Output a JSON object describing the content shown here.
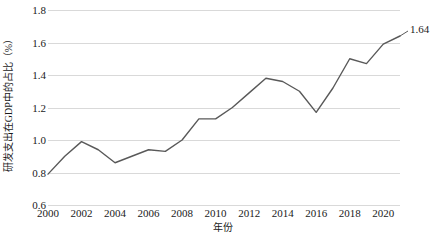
{
  "chart_data": {
    "type": "line",
    "title": "",
    "xlabel": "年份",
    "ylabel": "研发支出在GDP中的占比（%）",
    "x": [
      2000,
      2001,
      2002,
      2003,
      2004,
      2005,
      2006,
      2007,
      2008,
      2009,
      2010,
      2011,
      2012,
      2013,
      2014,
      2015,
      2016,
      2017,
      2018,
      2019,
      2020,
      2021
    ],
    "values": [
      0.79,
      0.9,
      0.99,
      0.94,
      0.86,
      0.9,
      0.94,
      0.93,
      1.0,
      1.13,
      1.13,
      1.2,
      1.29,
      1.38,
      1.36,
      1.3,
      1.17,
      1.32,
      1.5,
      1.47,
      1.59,
      1.64
    ],
    "series": [
      {
        "name": "研发支出在GDP中的占比（%）",
        "values": [
          0.79,
          0.9,
          0.99,
          0.94,
          0.86,
          0.9,
          0.94,
          0.93,
          1.0,
          1.13,
          1.13,
          1.2,
          1.29,
          1.38,
          1.36,
          1.3,
          1.17,
          1.32,
          1.5,
          1.47,
          1.59,
          1.64
        ]
      }
    ],
    "xlim": [
      2000,
      2021
    ],
    "ylim": [
      0.6,
      1.8
    ],
    "y_ticks": [
      0.6,
      0.8,
      1.0,
      1.2,
      1.4,
      1.6,
      1.8
    ],
    "y_tick_labels": [
      "0.6",
      "0.8",
      "1.0",
      "1.2",
      "1.4",
      "1.6",
      "1.8"
    ],
    "x_ticks": [
      2000,
      2002,
      2004,
      2006,
      2008,
      2010,
      2012,
      2014,
      2016,
      2018,
      2020
    ],
    "x_tick_labels": [
      "2000",
      "2002",
      "2004",
      "2006",
      "2008",
      "2010",
      "2012",
      "2014",
      "2016",
      "2018",
      "2020"
    ],
    "grid": "horizontal",
    "legend": "none",
    "annotations": [
      {
        "text": "1.64",
        "x": 2021,
        "y": 1.64
      }
    ],
    "line_color": "#595959",
    "grid_color": "#d9d9d9",
    "background_color": "#ffffff",
    "end_label": "1.64"
  }
}
